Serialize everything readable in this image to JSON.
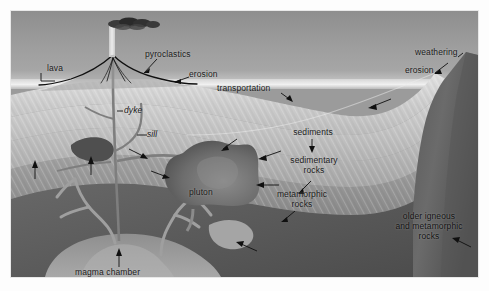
{
  "figure": {
    "frame_color": "#e8e8e8",
    "background_color": "#9b9b9b"
  },
  "palette": {
    "sky_top": "#8e8e8e",
    "sky_bottom": "#dcdcdc",
    "sediment_light": "#d9d9d9",
    "sediment_mid": "#c2c2c2",
    "sedimentary_rock": "#b0b0b0",
    "metamorphic": "#8f8f8f",
    "basement_dark": "#5e5e5e",
    "magma": "#9a9a9a",
    "pluton": "#6a6a6a",
    "lava_line": "#121212",
    "label_text": "#1b1b1b"
  },
  "labels": [
    {
      "id": "lava",
      "text": "lava",
      "x": 36,
      "y": 58
    },
    {
      "id": "pyroclastics",
      "text": "pyroclastics",
      "x": 134,
      "y": 44
    },
    {
      "id": "erosion-left",
      "text": "erosion",
      "x": 178,
      "y": 65
    },
    {
      "id": "transportation",
      "text": "transportation",
      "x": 228,
      "y": 78
    },
    {
      "id": "weathering",
      "text": "weathering",
      "x": 424,
      "y": 42
    },
    {
      "id": "erosion-right",
      "text": "erosion",
      "x": 409,
      "y": 61
    },
    {
      "id": "dyke",
      "text": "dyke",
      "x": 115,
      "y": 99
    },
    {
      "id": "sill",
      "text": "sill",
      "x": 138,
      "y": 123
    },
    {
      "id": "sediments",
      "text": "sediments",
      "x": 300,
      "y": 122
    },
    {
      "id": "sedimentary-rocks",
      "text": "sedimentary\nrocks",
      "x": 303,
      "y": 150
    },
    {
      "id": "metamorphic-rocks",
      "text": "metamorphic\nrocks",
      "x": 292,
      "y": 184
    },
    {
      "id": "pluton",
      "text": "pluton",
      "x": 192,
      "y": 182
    },
    {
      "id": "older-rocks",
      "text": "older igneous\nand metamorphic\nrocks",
      "x": 418,
      "y": 207
    },
    {
      "id": "magma-chamber",
      "text": "magma chamber",
      "x": 110,
      "y": 262
    }
  ],
  "features": [
    {
      "id": "eruption-column",
      "name": "eruption column"
    },
    {
      "id": "ash-cloud",
      "name": "pyroclastic ash cloud"
    },
    {
      "id": "lava-flows",
      "name": "lava flows"
    },
    {
      "id": "volcano-cone",
      "name": "volcanic cone"
    },
    {
      "id": "dyke-conduit",
      "name": "dyke"
    },
    {
      "id": "sill-intrusion",
      "name": "sill"
    },
    {
      "id": "pluton-body",
      "name": "pluton"
    },
    {
      "id": "magma-chamber-body",
      "name": "magma chamber"
    },
    {
      "id": "mountain-peak",
      "name": "eroding mountain"
    },
    {
      "id": "sediment-layers",
      "name": "sediment strata"
    },
    {
      "id": "basement-rock",
      "name": "older igneous and metamorphic basement"
    }
  ]
}
